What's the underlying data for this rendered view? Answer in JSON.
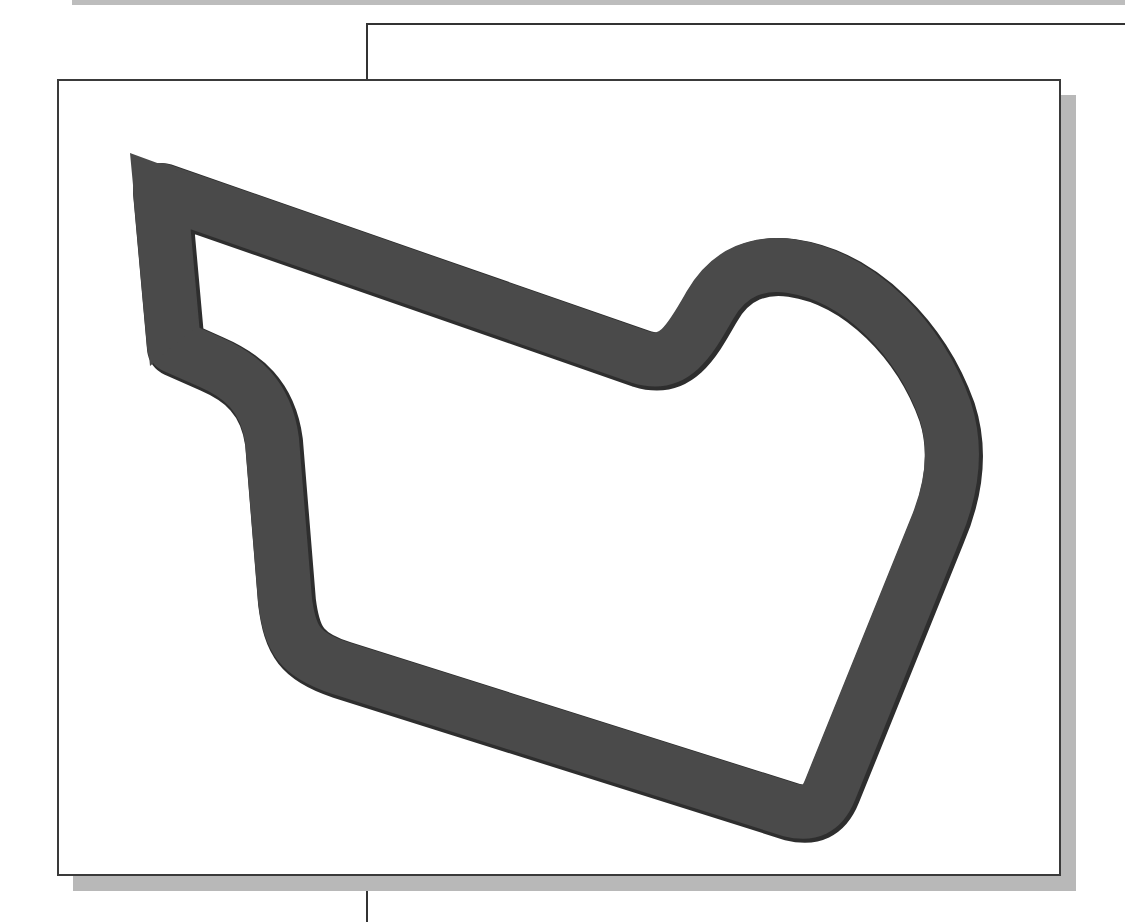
{
  "figure": {
    "colors": {
      "shape_fill": "#4a4a4a",
      "shape_edge": "#2e2e2e",
      "frame_border": "#3a3a3a",
      "frame_shadow": "#b8b8b8",
      "background": "#ffffff"
    },
    "shape": {
      "name": "extruded-loop",
      "stroke_width": 56
    }
  }
}
